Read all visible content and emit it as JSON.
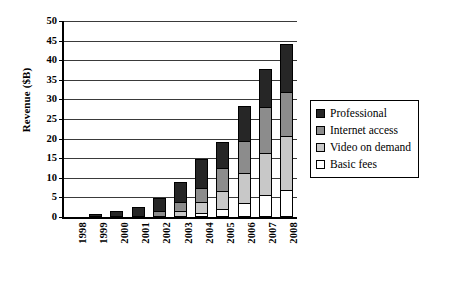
{
  "chart_data": {
    "type": "bar",
    "stacked": true,
    "title": "",
    "xlabel": "",
    "ylabel": "Revenue ($B)",
    "ylim": [
      0,
      50
    ],
    "ytick_step": 5,
    "ytick_labels": [
      "50",
      "45",
      "40",
      "35",
      "30",
      "25",
      "20",
      "15",
      "10",
      "5",
      "0"
    ],
    "grid": true,
    "legend_position": "right",
    "categories": [
      "1998",
      "1999",
      "2000",
      "2001",
      "2002",
      "2003",
      "2004",
      "2005",
      "2006",
      "2007",
      "2008"
    ],
    "series": [
      {
        "name": "Basic fees",
        "color": "#ffffff",
        "values": [
          0,
          0,
          0,
          0,
          0,
          0,
          1.0,
          2.0,
          3.5,
          5.5,
          7.0
        ]
      },
      {
        "name": "Video on demand",
        "color": "#c8c8c8",
        "values": [
          0,
          0,
          0,
          0,
          0,
          1.5,
          3.0,
          5.0,
          8.0,
          11.0,
          14.0
        ]
      },
      {
        "name": "Internet access",
        "color": "#8c8c8c",
        "values": [
          0,
          0,
          0,
          0,
          1.5,
          2.5,
          4.0,
          6.0,
          8.5,
          12.0,
          11.5
        ]
      },
      {
        "name": "Professional",
        "color": "#262626",
        "values": [
          0,
          0.8,
          1.5,
          2.5,
          3.5,
          5.5,
          7.5,
          7.0,
          9.0,
          10.0,
          12.5
        ]
      }
    ],
    "totals": [
      0,
      0.8,
      1.5,
      2.5,
      5.0,
      9.5,
      15.5,
      20.0,
      29.0,
      38.5,
      45.0
    ]
  },
  "legend": {
    "items": [
      {
        "label": "Professional",
        "color": "#262626"
      },
      {
        "label": "Internet access",
        "color": "#8c8c8c"
      },
      {
        "label": "Video on demand",
        "color": "#c8c8c8"
      },
      {
        "label": "Basic fees",
        "color": "#ffffff"
      }
    ]
  }
}
